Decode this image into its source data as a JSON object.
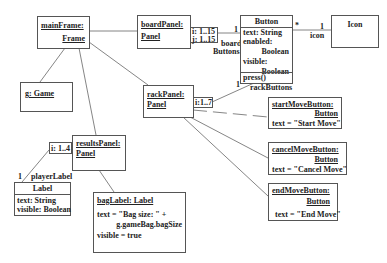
{
  "diagram": {
    "type": "UML object diagram",
    "objects": {
      "mainFrame": {
        "name": "mainFrame:",
        "class": "Frame"
      },
      "boardPanel": {
        "name": "boardPanel:",
        "class": "Panel",
        "qualifiers": [
          "i: 1..15",
          "j: 1..15"
        ]
      },
      "button": {
        "class": "Button",
        "attributes": [
          "text: String",
          "enabled:",
          "Boolean",
          "visible:",
          "Boolean"
        ],
        "operations": [
          "press()"
        ]
      },
      "icon": {
        "class": "Icon"
      },
      "game": {
        "name": "g: Game"
      },
      "rackPanel": {
        "name": "rackPanel:",
        "class": "Panel",
        "qualifier": "i:1..7"
      },
      "startMoveButton": {
        "name": "startMoveButton:",
        "class": "Button",
        "attr": "text = \"Start Move\""
      },
      "cancelMoveButton": {
        "name": "cancelMoveButton:",
        "class": "Button",
        "attr": "text = \"Cancel Move\""
      },
      "endMoveButton": {
        "name": "endMoveButton:",
        "class": "Button",
        "attr": "text = \"End Move\""
      },
      "resultsPanel": {
        "name": "resultsPanel:",
        "class": "Panel",
        "qualifier": "i: 1..4"
      },
      "playerLabel": {
        "class": "Label",
        "attributes": [
          "text: String",
          "visible: Boolean"
        ]
      },
      "bagLabel": {
        "name": "bagLabel:  Label",
        "attr1": "text = \"Bag size: \" +",
        "attr2": "g.gameBag.bagSize",
        "attr3": "visible = true"
      }
    },
    "association_labels": {
      "board_mult": "1",
      "board_role_1": "board",
      "board_role_2": "Buttons",
      "icon_star": "*",
      "icon_mult": "1",
      "icon_role": "icon",
      "rack_mult": "1",
      "rack_role": "rackButtons",
      "player_mult": "1",
      "player_role": "playerLabel"
    }
  }
}
